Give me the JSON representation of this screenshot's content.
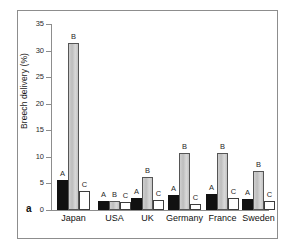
{
  "figure": {
    "panel_letter": "a",
    "ylabel": "Breech delivery (%)",
    "ytick_labels": [
      "0",
      "5",
      "10",
      "15",
      "20",
      "25",
      "30",
      "35"
    ],
    "colors": {
      "series_a": "#111111",
      "series_b": "#c8c8c8",
      "series_c": "#ffffff",
      "axis": "#8d8d8d",
      "frame": "#8d8d8d",
      "background": "#ffffff"
    }
  },
  "chart_data": {
    "type": "bar",
    "title": "",
    "xlabel": "",
    "ylabel": "Breech delivery (%)",
    "ylim": [
      0,
      35
    ],
    "yticks": [
      0,
      5,
      10,
      15,
      20,
      25,
      30,
      35
    ],
    "grid": false,
    "legend": "none",
    "panel_label": "a",
    "categories": [
      "Japan",
      "USA",
      "UK",
      "Germany",
      "France",
      "Sweden"
    ],
    "series": [
      {
        "name": "A",
        "label": "A",
        "fill": "black",
        "values": [
          5.7,
          1.6,
          2.2,
          2.8,
          3.0,
          2.0
        ]
      },
      {
        "name": "B",
        "label": "B",
        "fill": "gray",
        "values": [
          31.5,
          1.7,
          6.3,
          10.8,
          10.7,
          7.4
        ]
      },
      {
        "name": "C",
        "label": "C",
        "fill": "white",
        "values": [
          3.6,
          1.5,
          1.9,
          1.1,
          2.2,
          1.7
        ]
      }
    ],
    "bar_labels": [
      [
        "A",
        "B",
        "C"
      ],
      [
        "A",
        "B",
        "C"
      ],
      [
        "A",
        "B",
        "C"
      ],
      [
        "A",
        "B",
        "C"
      ],
      [
        "A",
        "B",
        "C"
      ],
      [
        "A",
        "B",
        "C"
      ]
    ]
  }
}
